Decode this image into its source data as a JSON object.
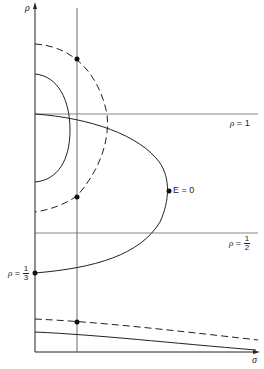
{
  "diagram": {
    "axes": {
      "y_label": "ρ",
      "x_label": "σ"
    },
    "labels": {
      "rho_one": {
        "var": "ρ",
        "eq": "=",
        "value": "1"
      },
      "rho_half": {
        "var": "ρ",
        "eq": "=",
        "num": "1",
        "den": "2"
      },
      "rho_third": {
        "var": "ρ",
        "eq": "=",
        "num": "1",
        "den": "3"
      },
      "energy_zero": "E = 0"
    },
    "colors": {
      "ink": "#222222",
      "background": "#ffffff"
    }
  }
}
